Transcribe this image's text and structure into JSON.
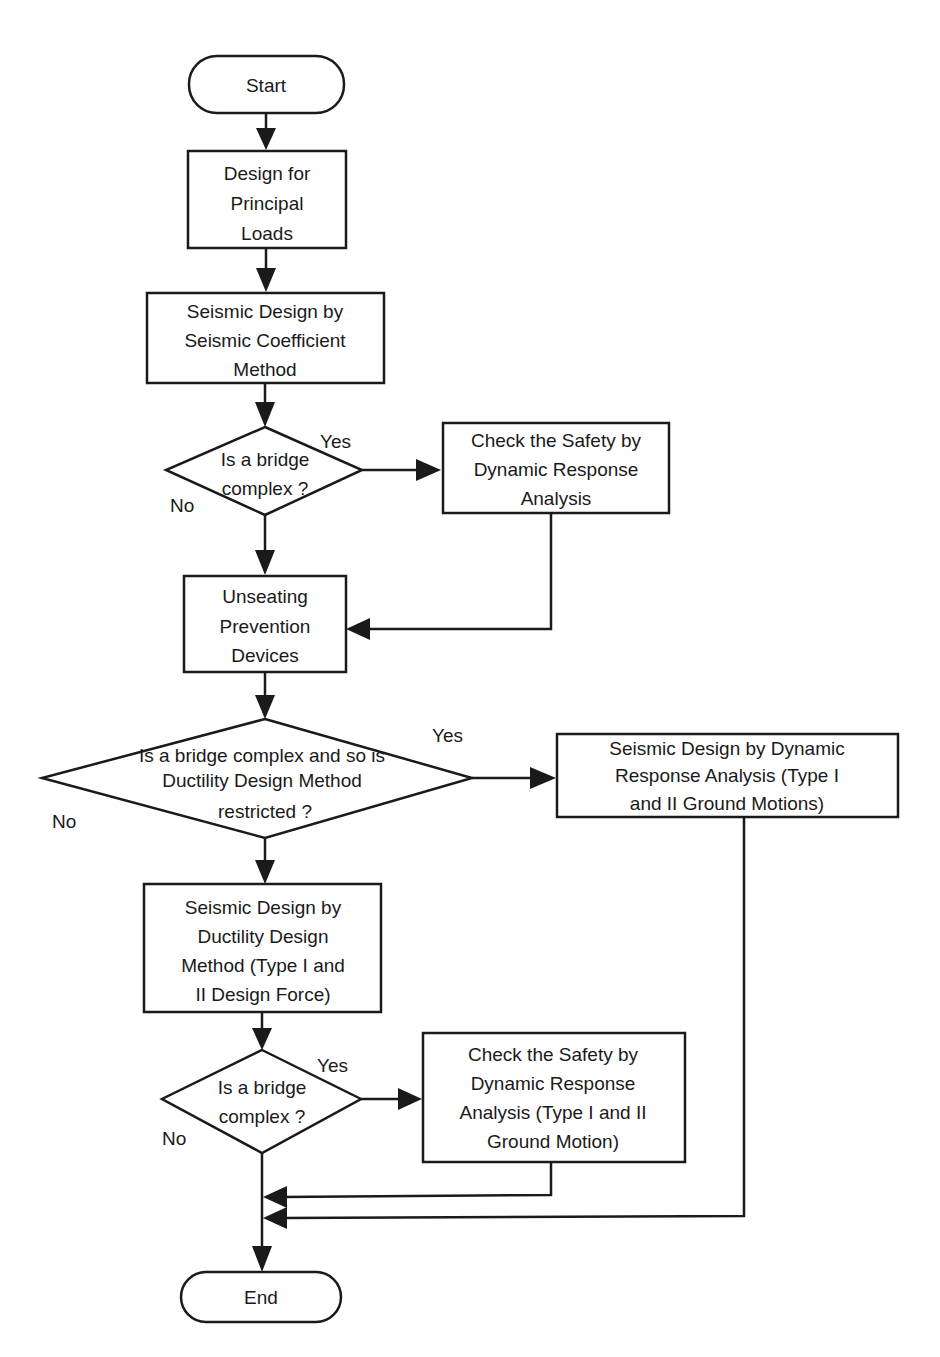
{
  "diagram": {
    "type": "flowchart",
    "nodes": {
      "start": {
        "kind": "terminal",
        "lines": [
          "Start"
        ]
      },
      "principal": {
        "kind": "process",
        "lines": [
          "Design for",
          "Principal",
          "Loads"
        ]
      },
      "seismic_coef": {
        "kind": "process",
        "lines": [
          "Seismic Design by",
          "Seismic Coefficient",
          "Method"
        ]
      },
      "decision1": {
        "kind": "decision",
        "lines": [
          "Is a bridge",
          "complex ?"
        ],
        "yes": "Yes",
        "no": "No"
      },
      "check1": {
        "kind": "process",
        "lines": [
          "Check the Safety by",
          "Dynamic Response",
          "Analysis"
        ]
      },
      "unseating": {
        "kind": "process",
        "lines": [
          "Unseating",
          "Prevention",
          "Devices"
        ]
      },
      "decision2": {
        "kind": "decision",
        "lines": [
          "Is a bridge complex and so is",
          "Ductility Design Method",
          "restricted ?"
        ],
        "yes": "Yes",
        "no": "No"
      },
      "dynamic_design": {
        "kind": "process",
        "lines": [
          "Seismic Design by Dynamic",
          "Response Analysis (Type I",
          "and II Ground Motions)"
        ]
      },
      "ductility": {
        "kind": "process",
        "lines": [
          "Seismic Design by",
          "Ductility Design",
          "Method (Type I and",
          "II Design Force)"
        ]
      },
      "decision3": {
        "kind": "decision",
        "lines": [
          "Is a bridge",
          "complex ?"
        ],
        "yes": "Yes",
        "no": "No"
      },
      "check2": {
        "kind": "process",
        "lines": [
          "Check the Safety by",
          "Dynamic Response",
          "Analysis (Type I and II",
          "Ground Motion)"
        ]
      },
      "end": {
        "kind": "terminal",
        "lines": [
          "End"
        ]
      }
    },
    "edges": [
      {
        "from": "start",
        "to": "principal"
      },
      {
        "from": "principal",
        "to": "seismic_coef"
      },
      {
        "from": "seismic_coef",
        "to": "decision1"
      },
      {
        "from": "decision1",
        "to": "check1",
        "label": "Yes"
      },
      {
        "from": "decision1",
        "to": "unseating",
        "label": "No"
      },
      {
        "from": "check1",
        "to": "unseating"
      },
      {
        "from": "unseating",
        "to": "decision2"
      },
      {
        "from": "decision2",
        "to": "dynamic_design",
        "label": "Yes"
      },
      {
        "from": "decision2",
        "to": "ductility",
        "label": "No"
      },
      {
        "from": "ductility",
        "to": "decision3"
      },
      {
        "from": "decision3",
        "to": "check2",
        "label": "Yes"
      },
      {
        "from": "decision3",
        "to": "end",
        "label": "No"
      },
      {
        "from": "check2",
        "to": "end"
      },
      {
        "from": "dynamic_design",
        "to": "end"
      }
    ]
  }
}
